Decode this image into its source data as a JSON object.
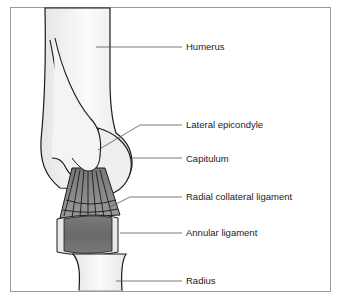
{
  "diagram": {
    "labels": [
      {
        "id": "humerus",
        "text": "Humerus",
        "x": 186,
        "y": 41
      },
      {
        "id": "lateral-epicondyle",
        "text": "Lateral epicondyle",
        "x": 186,
        "y": 119
      },
      {
        "id": "capitulum",
        "text": "Capitulum",
        "x": 186,
        "y": 153
      },
      {
        "id": "radial-collateral-ligament",
        "text": "Radial collateral ligament",
        "x": 186,
        "y": 191
      },
      {
        "id": "annular-ligament",
        "text": "Annular ligament",
        "x": 186,
        "y": 227
      },
      {
        "id": "radius",
        "text": "Radius",
        "x": 186,
        "y": 275
      }
    ],
    "colors": {
      "frame": "#9a9a9a",
      "outline": "#1a1a1a",
      "bone": "#f2f2f2",
      "ligament": "#8a8a8a",
      "annular": "#6e6e6e",
      "leader": "#555555"
    }
  }
}
